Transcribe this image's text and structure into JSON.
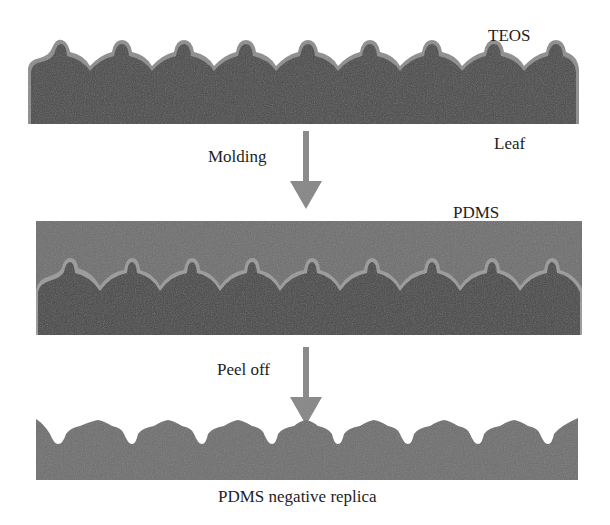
{
  "diagram": {
    "type": "process-flow",
    "steps": [
      {
        "id": "leaf-teos",
        "labels": {
          "coating": "TEOS",
          "substrate": "Leaf"
        }
      },
      {
        "id": "molding",
        "arrow_label": "Molding"
      },
      {
        "id": "pdms-cast",
        "labels": {
          "material": "PDMS"
        }
      },
      {
        "id": "peel",
        "arrow_label": "Peel off"
      },
      {
        "id": "replica",
        "caption": "PDMS negative replica"
      }
    ]
  },
  "labels": {
    "teos": "TEOS",
    "leaf": "Leaf",
    "molding": "Molding",
    "pdms": "PDMS",
    "peel_off": "Peel off",
    "replica": "PDMS negative replica"
  },
  "colors": {
    "leaf": "#4a4a4a",
    "teos_coating": "#8c8c8c",
    "pdms": "#6e6e6e",
    "arrow": "#8a8a8a",
    "background": "#ffffff"
  },
  "structure": {
    "bump_count": 9
  }
}
